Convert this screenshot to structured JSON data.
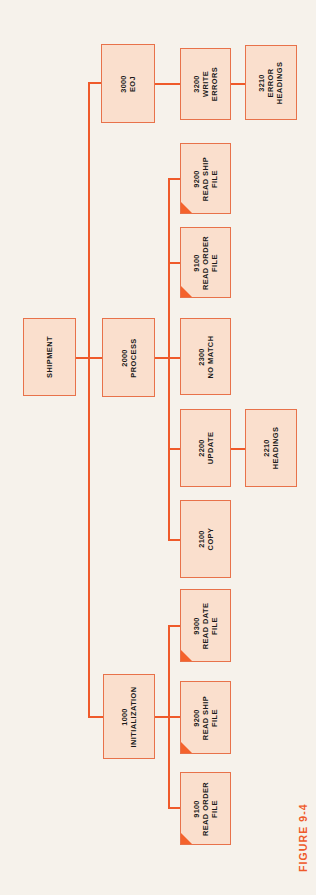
{
  "figure": {
    "caption": "FIGURE 9-4"
  },
  "colors": {
    "page_background": "#f6f2eb",
    "box_fill": "#fadfcd",
    "box_border": "#e8724a",
    "line": "#ef5a2a",
    "corner_marker": "#f4622c",
    "text": "#1b1b1b",
    "caption": "#ef5a2a"
  },
  "chart_data": {
    "type": "diagram",
    "diagram_kind": "structure-chart",
    "orientation": "rotated-90-counterclockwise",
    "title": "FIGURE 9-4",
    "root": "SHIPMENT",
    "nodes": [
      {
        "id": "shipment",
        "number": "",
        "name": "SHIPMENT",
        "level": 0,
        "marker": false
      },
      {
        "id": "1000",
        "number": "1000",
        "name": "INITIALIZATION",
        "level": 1,
        "marker": false
      },
      {
        "id": "2000",
        "number": "2000",
        "name": "PROCESS",
        "level": 1,
        "marker": false
      },
      {
        "id": "3000",
        "number": "3000",
        "name": "EOJ",
        "level": 1,
        "marker": false
      },
      {
        "id": "9100-init",
        "number": "9100",
        "name": "READ ORDER\nFILE",
        "level": 2,
        "marker": true
      },
      {
        "id": "9200-init",
        "number": "9200",
        "name": "READ SHIP\nFILE",
        "level": 2,
        "marker": true
      },
      {
        "id": "9300-init",
        "number": "9300",
        "name": "READ DATE\nFILE",
        "level": 2,
        "marker": true
      },
      {
        "id": "2100",
        "number": "2100",
        "name": "COPY",
        "level": 2,
        "marker": false
      },
      {
        "id": "2200",
        "number": "2200",
        "name": "UPDATE",
        "level": 2,
        "marker": false
      },
      {
        "id": "2300",
        "number": "2300",
        "name": "NO MATCH",
        "level": 2,
        "marker": false
      },
      {
        "id": "9100-proc",
        "number": "9100",
        "name": "READ ORDER\nFILE",
        "level": 2,
        "marker": true
      },
      {
        "id": "9200-proc",
        "number": "9200",
        "name": "READ SHIP\nFILE",
        "level": 2,
        "marker": true
      },
      {
        "id": "3200",
        "number": "3200",
        "name": "WRITE\nERRORS",
        "level": 2,
        "marker": false
      },
      {
        "id": "2210",
        "number": "2210",
        "name": "HEADINGS",
        "level": 3,
        "marker": false
      },
      {
        "id": "3210",
        "number": "3210",
        "name": "ERROR\nHEADINGS",
        "level": 3,
        "marker": false
      }
    ],
    "edges": [
      [
        "shipment",
        "1000"
      ],
      [
        "shipment",
        "2000"
      ],
      [
        "shipment",
        "3000"
      ],
      [
        "1000",
        "9100-init"
      ],
      [
        "1000",
        "9200-init"
      ],
      [
        "1000",
        "9300-init"
      ],
      [
        "2000",
        "2100"
      ],
      [
        "2000",
        "2200"
      ],
      [
        "2000",
        "2300"
      ],
      [
        "2000",
        "9100-proc"
      ],
      [
        "2000",
        "9200-proc"
      ],
      [
        "2200",
        "2210"
      ],
      [
        "3000",
        "3200"
      ],
      [
        "3200",
        "3210"
      ]
    ]
  },
  "boxes": [
    {
      "key": "shipment",
      "num": "",
      "l1": "SHIPMENT",
      "l2": "",
      "marker": false,
      "x": 23,
      "y": 318,
      "w": 53,
      "h": 78
    },
    {
      "key": "b3000",
      "num": "3000",
      "l1": "EOJ",
      "l2": "",
      "marker": false,
      "x": 101,
      "y": 44,
      "w": 54,
      "h": 79
    },
    {
      "key": "b2000",
      "num": "2000",
      "l1": "PROCESS",
      "l2": "",
      "marker": false,
      "x": 102,
      "y": 318,
      "w": 53,
      "h": 79
    },
    {
      "key": "b1000",
      "num": "1000",
      "l1": "INITIALIZATION",
      "l2": "",
      "marker": false,
      "x": 103,
      "y": 674,
      "w": 52,
      "h": 85
    },
    {
      "key": "b3200",
      "num": "3200",
      "l1": "WRITE",
      "l2": "ERRORS",
      "marker": false,
      "x": 180,
      "y": 48,
      "w": 51,
      "h": 72
    },
    {
      "key": "b9200p",
      "num": "9200",
      "l1": "READ SHIP",
      "l2": "FILE",
      "marker": true,
      "x": 180,
      "y": 143,
      "w": 51,
      "h": 71
    },
    {
      "key": "b9100p",
      "num": "9100",
      "l1": "READ ORDER",
      "l2": "FILE",
      "marker": true,
      "x": 180,
      "y": 227,
      "w": 51,
      "h": 71
    },
    {
      "key": "b2300",
      "num": "2300",
      "l1": "NO MATCH",
      "l2": "",
      "marker": false,
      "x": 180,
      "y": 318,
      "w": 51,
      "h": 77
    },
    {
      "key": "b2200",
      "num": "2200",
      "l1": "UPDATE",
      "l2": "",
      "marker": false,
      "x": 180,
      "y": 409,
      "w": 51,
      "h": 78
    },
    {
      "key": "b2100",
      "num": "2100",
      "l1": "COPY",
      "l2": "",
      "marker": false,
      "x": 180,
      "y": 500,
      "w": 51,
      "h": 78
    },
    {
      "key": "b9300i",
      "num": "9300",
      "l1": "READ DATE",
      "l2": "FILE",
      "marker": true,
      "x": 180,
      "y": 589,
      "w": 51,
      "h": 73
    },
    {
      "key": "b9200i",
      "num": "9200",
      "l1": "READ SHIP",
      "l2": "FILE",
      "marker": true,
      "x": 180,
      "y": 681,
      "w": 51,
      "h": 73
    },
    {
      "key": "b9100i",
      "num": "9100",
      "l1": "READ ORDER",
      "l2": "FILE",
      "marker": true,
      "x": 180,
      "y": 772,
      "w": 51,
      "h": 73
    },
    {
      "key": "b3210",
      "num": "3210",
      "l1": "ERROR",
      "l2": "HEADINGS",
      "marker": false,
      "x": 245,
      "y": 45,
      "w": 52,
      "h": 75
    },
    {
      "key": "b2210",
      "num": "2210",
      "l1": "HEADINGS",
      "l2": "",
      "marker": false,
      "x": 245,
      "y": 409,
      "w": 52,
      "h": 78
    }
  ],
  "lines": [
    {
      "key": "trunk-main",
      "orient": "v",
      "x": 88,
      "y": 82,
      "len": 636
    },
    {
      "key": "trunk-to-3000",
      "orient": "h",
      "x": 88,
      "y": 82,
      "len": 14
    },
    {
      "key": "trunk-to-2000",
      "orient": "h",
      "x": 76,
      "y": 357,
      "len": 27
    },
    {
      "key": "trunk-to-1000",
      "orient": "h",
      "x": 88,
      "y": 716,
      "len": 16
    },
    {
      "key": "eoj-to-3200",
      "orient": "h",
      "x": 155,
      "y": 83,
      "len": 26
    },
    {
      "key": "w-to-3210",
      "orient": "h",
      "x": 231,
      "y": 83,
      "len": 15
    },
    {
      "key": "proc-out",
      "orient": "h",
      "x": 155,
      "y": 357,
      "len": 26
    },
    {
      "key": "proc-bus",
      "orient": "v",
      "x": 168,
      "y": 178,
      "len": 361
    },
    {
      "key": "proc-9200",
      "orient": "h",
      "x": 168,
      "y": 178,
      "len": 13
    },
    {
      "key": "proc-9100",
      "orient": "h",
      "x": 168,
      "y": 262,
      "len": 13
    },
    {
      "key": "proc-2300",
      "orient": "h",
      "x": 168,
      "y": 357,
      "len": 13
    },
    {
      "key": "proc-2200",
      "orient": "h",
      "x": 168,
      "y": 448,
      "len": 13
    },
    {
      "key": "proc-2100",
      "orient": "h",
      "x": 168,
      "y": 539,
      "len": 13
    },
    {
      "key": "upd-to-2210",
      "orient": "h",
      "x": 231,
      "y": 448,
      "len": 15
    },
    {
      "key": "init-out",
      "orient": "h",
      "x": 155,
      "y": 716,
      "len": 26
    },
    {
      "key": "init-bus",
      "orient": "v",
      "x": 168,
      "y": 625,
      "len": 184
    },
    {
      "key": "init-9300",
      "orient": "h",
      "x": 168,
      "y": 625,
      "len": 13
    },
    {
      "key": "init-9200",
      "orient": "h",
      "x": 168,
      "y": 716,
      "len": 13
    },
    {
      "key": "init-9100",
      "orient": "h",
      "x": 168,
      "y": 807,
      "len": 13
    }
  ],
  "caption_pos": {
    "x": 297,
    "y": 872
  }
}
